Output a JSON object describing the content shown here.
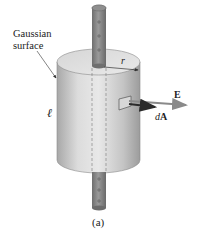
{
  "figure": {
    "caption": "(a)",
    "labels": {
      "gaussian_surface_line1": "Gaussian",
      "gaussian_surface_line2": "surface",
      "length": "ℓ",
      "radius": "r",
      "field": "E",
      "area_element_prefix": "d",
      "area_element_vector": "A"
    },
    "rod_charges": [
      "+",
      "+",
      "+",
      "+",
      "+",
      "+",
      "+"
    ],
    "colors": {
      "cylinder_light": "#e6e6e6",
      "cylinder_dark": "#9a9a9a",
      "rod": "#7d7d7d",
      "arrow_E": "#8a8a8a",
      "arrow_dA": "#2b2b2b",
      "text": "#222222"
    }
  }
}
